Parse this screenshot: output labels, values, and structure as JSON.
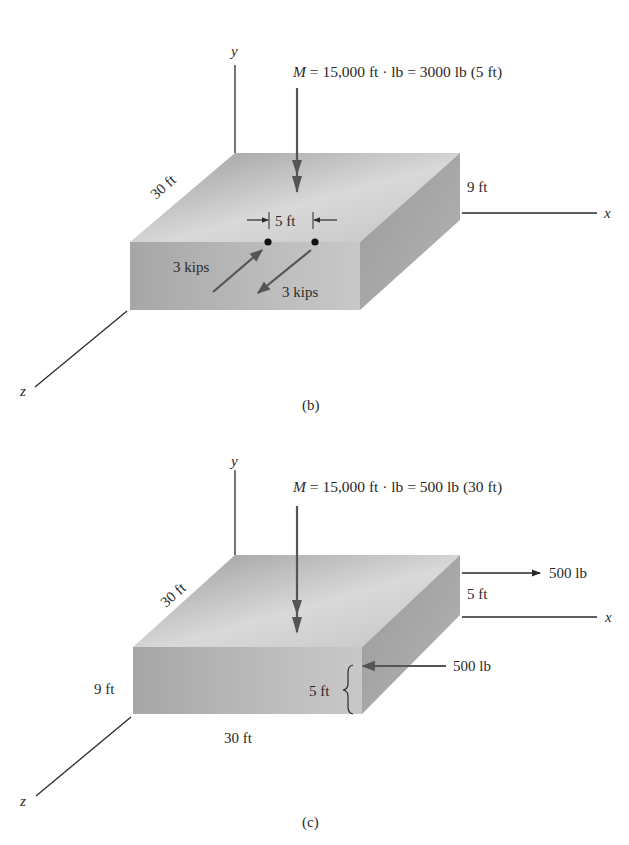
{
  "figure": {
    "panels": [
      {
        "id": "b",
        "caption": "(b)",
        "axes": {
          "x": "x",
          "y": "y",
          "z": "z"
        },
        "moment": {
          "symbol": "M",
          "equation": " = 15,000 ft · lb = 3000 lb (5 ft)"
        },
        "dimensions": {
          "depth": "30 ft",
          "height": "9 ft",
          "spacing": "5 ft"
        },
        "forces": [
          {
            "label": "3 kips",
            "direction": "toward back (−z)"
          },
          {
            "label": "3 kips",
            "direction": "toward front (+z)"
          }
        ]
      },
      {
        "id": "c",
        "caption": "(c)",
        "axes": {
          "x": "x",
          "y": "y",
          "z": "z"
        },
        "moment": {
          "symbol": "M",
          "equation": " = 15,000 ft · lb = 500 lb (30 ft)"
        },
        "dimensions": {
          "depth": "30 ft",
          "height": "9 ft",
          "width": "30 ft",
          "upper_spacing": "5 ft",
          "lower_spacing": "5 ft"
        },
        "forces": [
          {
            "label": "500 lb",
            "direction": "+x (upper, back face)"
          },
          {
            "label": "500 lb",
            "direction": "−x (lower, front)"
          }
        ]
      }
    ],
    "colors": {
      "top_face_light": "#d6d6d6",
      "top_face_dark": "#9c9c9c",
      "front_face": "#b0b0b0",
      "side_face": "#a2a2a2",
      "line": "#2a2a2a",
      "arrow": "#555555"
    }
  }
}
